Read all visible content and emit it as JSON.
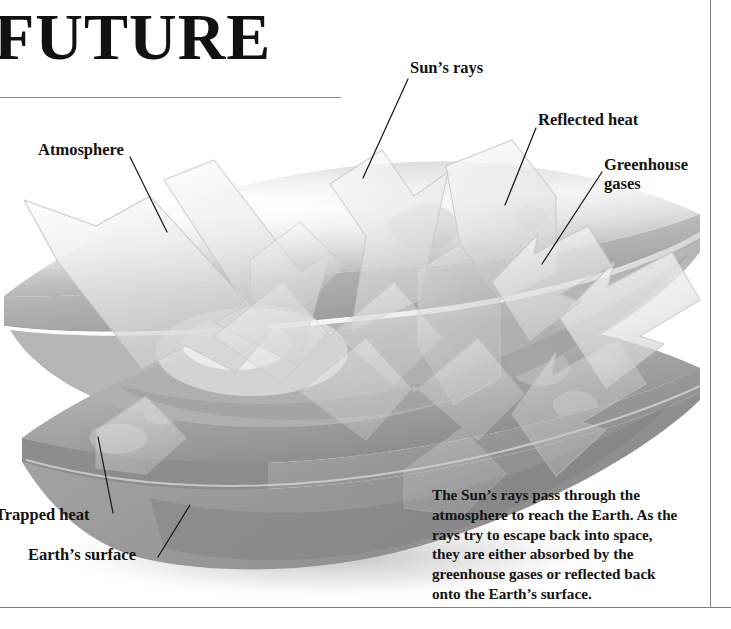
{
  "header": {
    "title": "FUTURE"
  },
  "figure": {
    "alt_name": "greenhouse-effect-diagram",
    "labels": {
      "atmosphere": "Atmosphere",
      "suns_rays": "Sun’s rays",
      "reflected_heat": "Reflected heat",
      "greenhouse_gases": "Greenhouse\ngases",
      "trapped_heat": "Trapped heat",
      "earths_surface": "Earth’s surface"
    },
    "caption": "The Sun’s rays pass through the atmosphere to reach the Earth. As the rays try to escape back into space, they are either absorbed by the greenhouse gases or reflected back onto the Earth’s surface."
  },
  "colors": {
    "ink": "#15120f",
    "rule": "#7e7e7e",
    "title_rule": "#8a8a8a",
    "slab_light": "#e9e9e9",
    "slab_mid": "#b4b4b4",
    "slab_dark": "#8f8f8f",
    "surface_gray": "#9c9c9c",
    "arrow_fill": "#ededed",
    "arrow_stroke": "#c9c9c9",
    "background": "#ffffff"
  }
}
